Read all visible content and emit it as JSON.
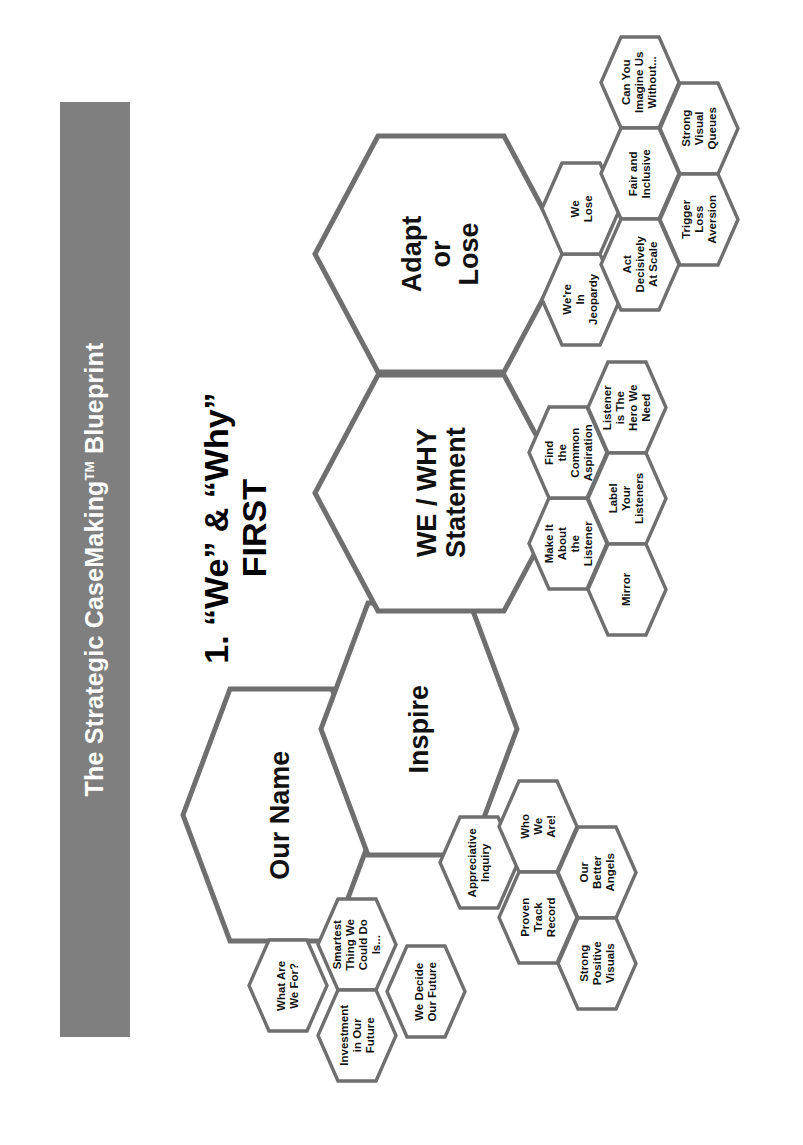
{
  "banner": {
    "title_before_tm": "The Strategic CaseMaking",
    "tm": "TM",
    "title_after_tm": "Blueprint",
    "bg_color": "#7f7f7f",
    "text_color": "#ffffff"
  },
  "headline": {
    "line1": "1. “We” & “Why”",
    "line2": "FIRST"
  },
  "diagram": {
    "type": "hex-cluster-diagram",
    "rotation_degrees": -90,
    "hex_fill": "#ffffff",
    "hex_stroke": "#6f6f6f",
    "main_hexes": [
      {
        "id": "our-name",
        "label": "Our Name"
      },
      {
        "id": "inspire",
        "label": "Inspire"
      },
      {
        "id": "we-why",
        "label": "WE / WHY\nStatement"
      },
      {
        "id": "adapt-lose",
        "label": "Adapt\nor\nLose"
      }
    ],
    "clusters": [
      {
        "id": "our-name-cluster",
        "parent": "our-name",
        "hexes": [
          {
            "id": "what-are-we-for",
            "label": "What Are\nWe For?"
          },
          {
            "id": "smartest-thing",
            "label": "Smartest\nThing We\nCould Do\nIs..."
          },
          {
            "id": "investment-future",
            "label": "Investment\nin Our\nFuture"
          },
          {
            "id": "we-decide-future",
            "label": "We Decide\nOur Future"
          }
        ]
      },
      {
        "id": "inspire-cluster",
        "parent": "inspire",
        "hexes": [
          {
            "id": "appreciative-inquiry",
            "label": "Appreciative\nInquiry"
          },
          {
            "id": "who-we-are",
            "label": "Who\nWe\nAre!"
          },
          {
            "id": "proven-track-record",
            "label": "Proven\nTrack\nRecord"
          },
          {
            "id": "our-better-angels",
            "label": "Our\nBetter\nAngels"
          },
          {
            "id": "strong-positive-visuals",
            "label": "Strong\nPositive\nVisuals"
          }
        ]
      },
      {
        "id": "we-why-cluster",
        "parent": "we-why",
        "hexes": [
          {
            "id": "make-it-about-listener",
            "label": "Make It\nAbout\nthe\nListener"
          },
          {
            "id": "find-common-aspiration",
            "label": "Find\nthe\nCommon\nAspiration"
          },
          {
            "id": "listener-is-hero",
            "label": "Listener\nis The\nHero We\nNeed"
          },
          {
            "id": "label-your-listeners",
            "label": "Label\nYour\nListeners"
          },
          {
            "id": "mirror",
            "label": "Mirror"
          }
        ]
      },
      {
        "id": "adapt-lose-cluster",
        "parent": "adapt-lose",
        "hexes": [
          {
            "id": "were-in-jeopardy",
            "label": "We're\nIn\nJeopardy"
          },
          {
            "id": "we-lose",
            "label": "We\nLose"
          },
          {
            "id": "can-you-imagine",
            "label": "Can You\nImagine Us\nWithout..."
          },
          {
            "id": "fair-and-inclusive",
            "label": "Fair and\nInclusive"
          },
          {
            "id": "act-decisively",
            "label": "Act\nDecisively\nAt Scale"
          },
          {
            "id": "strong-visual-queues",
            "label": "Strong\nVisual\nQueues"
          },
          {
            "id": "trigger-loss-aversion",
            "label": "Trigger\nLoss\nAversion"
          }
        ]
      }
    ]
  }
}
